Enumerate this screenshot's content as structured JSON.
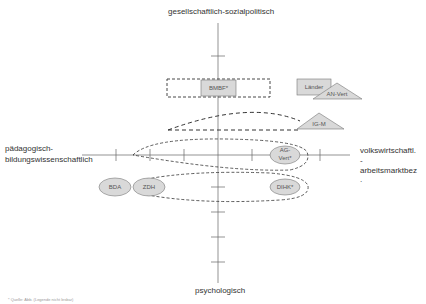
{
  "axes": {
    "top_label": "gesellschaftlich-sozialpolitisch",
    "bottom_label": "psychologisch",
    "left_label_line1": "pädagogisch-",
    "left_label_line2": "bildungswissenschaftlich",
    "right_label_line1": "volkswirtschaftl.",
    "right_label_line2": "-",
    "right_label_line3": "arbeitsmarktbez",
    "right_label_line4": "."
  },
  "actors": {
    "bmbf": "BMBF*",
    "laender": "Länder",
    "an_vert": "AN-Vert",
    "ig_m": "IG-M",
    "ag_vert_line1": "AG-",
    "ag_vert_line2": "Vert*",
    "bda": "BDA",
    "zdh": "ZDH",
    "dihk": "DIHK*"
  },
  "colors": {
    "axis": "#555555",
    "shape_fill": "#d9d9d9",
    "shape_stroke": "#777777",
    "dash": "#333333"
  },
  "footnote": "* Quelle: Abb. (Legende nicht lesbar)"
}
